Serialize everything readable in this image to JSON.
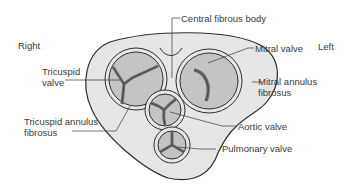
{
  "diagram": {
    "orientation": {
      "right": "Right",
      "left": "Left"
    },
    "labels": {
      "central_fibrous_body": "Central fibrous body",
      "mitral_valve": "Mitral valve",
      "mitral_annulus_line1": "Mitral annulus",
      "mitral_annulus_line2": "fibrosus",
      "tricuspid_valve_line1": "Tricuspid",
      "tricuspid_valve_line2": "valve",
      "tricuspid_annulus_line1": "Tricuspid annulus",
      "tricuspid_annulus_line2": "fibrosus",
      "aortic_valve": "Aortic valve",
      "pulmonary_valve": "Pulmonary valve"
    },
    "colors": {
      "skeleton_fill": "#e6e6e6",
      "valve_fill": "#c4c4c4",
      "leaflet_line": "#6e6e6e",
      "outline": "#2e2e2e",
      "text": "#3a3a3a"
    }
  }
}
